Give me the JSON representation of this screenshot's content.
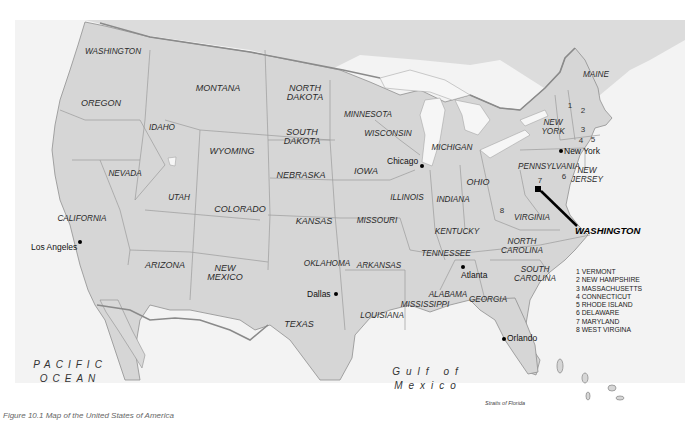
{
  "map": {
    "title": "Map of the United States",
    "colors": {
      "land": "#d6d6d6",
      "sea": "#f3f3f3",
      "border": "#8a8a8a",
      "text": "#2a2a2a"
    },
    "states": [
      {
        "id": "washington",
        "label": "WASHINGTON"
      },
      {
        "id": "oregon",
        "label": "OREGON"
      },
      {
        "id": "idaho",
        "label": "IDAHO"
      },
      {
        "id": "montana",
        "label": "MONTANA"
      },
      {
        "id": "north-dakota",
        "label": "NORTH\nDAKOTA"
      },
      {
        "id": "south-dakota",
        "label": "SOUTH\nDAKOTA"
      },
      {
        "id": "wyoming",
        "label": "WYOMING"
      },
      {
        "id": "nevada",
        "label": "NEVADA"
      },
      {
        "id": "california",
        "label": "CALIFORNIA"
      },
      {
        "id": "utah",
        "label": "UTAH"
      },
      {
        "id": "colorado",
        "label": "COLORADO"
      },
      {
        "id": "arizona",
        "label": "ARIZONA"
      },
      {
        "id": "new-mexico",
        "label": "NEW\nMEXICO"
      },
      {
        "id": "texas",
        "label": "TEXAS"
      },
      {
        "id": "oklahoma",
        "label": "OKLAHOMA"
      },
      {
        "id": "kansas",
        "label": "KANSAS"
      },
      {
        "id": "nebraska",
        "label": "NEBRASKA"
      },
      {
        "id": "minnesota",
        "label": "MINNESOTA"
      },
      {
        "id": "wisconsin",
        "label": "WISCONSIN"
      },
      {
        "id": "iowa",
        "label": "IOWA"
      },
      {
        "id": "missouri",
        "label": "MISSOURI"
      },
      {
        "id": "arkansas",
        "label": "ARKANSAS"
      },
      {
        "id": "louisiana",
        "label": "LOUISIANA"
      },
      {
        "id": "mississippi",
        "label": "MISSISSIPPI"
      },
      {
        "id": "alabama",
        "label": "ALABAMA"
      },
      {
        "id": "georgia",
        "label": "GEORGIA"
      },
      {
        "id": "tennessee",
        "label": "TENNESSEE"
      },
      {
        "id": "kentucky",
        "label": "KENTUCKY"
      },
      {
        "id": "illinois",
        "label": "ILLINOIS"
      },
      {
        "id": "indiana",
        "label": "INDIANA"
      },
      {
        "id": "michigan",
        "label": "MICHIGAN"
      },
      {
        "id": "ohio",
        "label": "OHIO"
      },
      {
        "id": "pennsylvania",
        "label": "PENNSYLVANIA"
      },
      {
        "id": "new-york",
        "label": "NEW\nYORK"
      },
      {
        "id": "new-jersey",
        "label": "NEW\nJERSEY"
      },
      {
        "id": "virginia",
        "label": "VIRGINIA"
      },
      {
        "id": "north-carolina",
        "label": "NORTH\nCAROLINA"
      },
      {
        "id": "south-carolina",
        "label": "SOUTH\nCAROLINA"
      },
      {
        "id": "maine",
        "label": "MAINE"
      }
    ],
    "numbered_states": [
      "1",
      "2",
      "3",
      "4",
      "5",
      "6",
      "7",
      "8"
    ],
    "cities": [
      {
        "id": "los-angeles",
        "label": "Los Angeles"
      },
      {
        "id": "chicago",
        "label": "Chicago"
      },
      {
        "id": "new-york",
        "label": "New York"
      },
      {
        "id": "dallas",
        "label": "Dallas"
      },
      {
        "id": "atlanta",
        "label": "Atlanta"
      },
      {
        "id": "orlando",
        "label": "Orlando"
      }
    ],
    "capital": {
      "label": "WASHINGTON"
    },
    "water": {
      "pacific": "PACIFIC\nOCEAN",
      "gulf": "Gulf of\nMexico",
      "strait": "Straits of Florida"
    },
    "legend": [
      "1 VERMONT",
      "2 NEW HAMPSHIRE",
      "3 MASSACHUSETTS",
      "4 CONNECTICUT",
      "5 RHODE ISLAND",
      "6 DELAWARE",
      "7 MARYLAND",
      "8 WEST VIRGINA"
    ],
    "caption": "Figure 10.1 Map of the United States of America"
  }
}
